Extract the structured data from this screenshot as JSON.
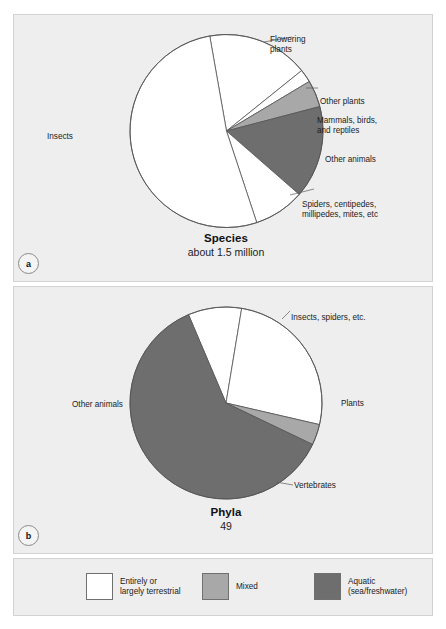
{
  "figure": {
    "background": "#ffffff",
    "panel_background": "#eeeeee",
    "panel_border": "#d2d2d2"
  },
  "colors": {
    "terrestrial": "#ffffff",
    "mixed": "#a8a8a8",
    "aquatic": "#6e6e6e",
    "outline": "#555555",
    "text": "#1b1b1b"
  },
  "panel_a": {
    "badge": "a",
    "caption_title": "Species",
    "caption_subtitle": "about 1.5 million",
    "labels": {
      "flowering_plants": "Flowering\nplants",
      "other_plants": "Other plants",
      "mammals_birds_reptiles": "Mammals, birds,\nand reptiles",
      "other_animals": "Other animals",
      "spiders_etc": "Spiders, centipedes,\nmillipedes, mites, etc",
      "insects": "Insects"
    }
  },
  "panel_b": {
    "badge": "b",
    "caption_title": "Phyla",
    "caption_subtitle": "49",
    "labels": {
      "insects_spiders": "Insects, spiders, etc.",
      "plants": "Plants",
      "vertebrates": "Vertebrates",
      "other_animals": "Other animals"
    }
  },
  "legend": {
    "items": [
      {
        "label": "Entirely or\nlargely terrestrial",
        "color": "#ffffff",
        "swatch_name": "terrestrial"
      },
      {
        "label": "Mixed",
        "color": "#a8a8a8",
        "swatch_name": "mixed"
      },
      {
        "label": "Aquatic\n(sea/freshwater)",
        "color": "#6e6e6e",
        "swatch_name": "aquatic"
      }
    ]
  },
  "chart_data": [
    {
      "type": "pie",
      "id": "species",
      "title": "Species",
      "subtitle": "about 1.5 million",
      "total_label": "about 1.5 million",
      "center": [
        226.5,
        131
      ],
      "radius": 96.5,
      "start_angle_deg": -10,
      "legend_position": "outside-labels",
      "categories": [
        "Flowering plants",
        "Other plants",
        "Mammals, birds, and reptiles",
        "Other animals",
        "Spiders, centipedes, millipedes, mites, etc",
        "Insects"
      ],
      "values": [
        17.0,
        2.2,
        4.5,
        15.5,
        8.5,
        52.3
      ],
      "value_unit": "percent",
      "colors": [
        "#ffffff",
        "#ffffff",
        "#a8a8a8",
        "#6e6e6e",
        "#ffffff",
        "#ffffff"
      ],
      "habitat_class": [
        "terrestrial",
        "terrestrial",
        "mixed",
        "aquatic",
        "terrestrial",
        "terrestrial"
      ]
    },
    {
      "type": "pie",
      "id": "phyla",
      "title": "Phyla",
      "subtitle": "49",
      "total_label": "49",
      "center": [
        226,
        403
      ],
      "radius": 96,
      "start_angle_deg": -23,
      "legend_position": "outside-labels",
      "categories": [
        "Insects, spiders, etc.",
        "Plants",
        "Vertebrates",
        "Other animals"
      ],
      "values": [
        9.0,
        26.0,
        3.5,
        61.5
      ],
      "value_unit": "percent",
      "colors": [
        "#ffffff",
        "#ffffff",
        "#a8a8a8",
        "#6e6e6e"
      ],
      "habitat_class": [
        "terrestrial",
        "terrestrial",
        "mixed",
        "aquatic"
      ]
    }
  ]
}
